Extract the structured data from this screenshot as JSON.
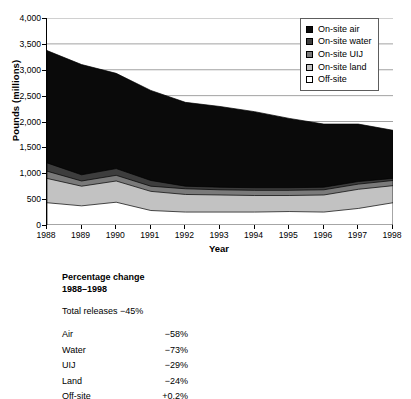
{
  "chart_data": {
    "type": "area",
    "stacked": true,
    "title": "",
    "xlabel": "Year",
    "ylabel": "Pounds (millions)",
    "x": [
      1988,
      1989,
      1990,
      1991,
      1992,
      1993,
      1994,
      1995,
      1996,
      1997,
      1998
    ],
    "xtick_labels": [
      "1988",
      "1989",
      "1990",
      "1991",
      "1992",
      "1993",
      "1994",
      "1995",
      "1996",
      "1997",
      "1998"
    ],
    "ytick_labels": [
      "0",
      "500",
      "1,000",
      "1,500",
      "2,000",
      "2,500",
      "3,000",
      "3,500",
      "4,000"
    ],
    "ylim": [
      0,
      4000
    ],
    "ytick_step": 500,
    "grid": "horizontal",
    "legend_position": "top-right",
    "stack_order_bottom_to_top": [
      "Off-site",
      "On-site land",
      "On-site UIJ",
      "On-site water",
      "On-site air"
    ],
    "series": [
      {
        "name": "On-site air",
        "color": "#0a0a0a",
        "values": [
          2170,
          2130,
          1840,
          1740,
          1620,
          1560,
          1470,
          1340,
          1220,
          1110,
          930
        ],
        "cumulative_top": [
          3370,
          3100,
          2930,
          2600,
          2370,
          2290,
          2190,
          2060,
          1950,
          1950,
          1830
        ]
      },
      {
        "name": "On-site water",
        "color": "#3d3d3d",
        "values": [
          160,
          120,
          130,
          110,
          50,
          50,
          50,
          50,
          50,
          50,
          40
        ],
        "cumulative_top": [
          1200,
          970,
          1090,
          860,
          750,
          730,
          720,
          720,
          730,
          840,
          900
        ]
      },
      {
        "name": "On-site UIJ",
        "color": "#7a7a7a",
        "values": [
          140,
          100,
          110,
          100,
          110,
          100,
          100,
          100,
          100,
          100,
          100
        ],
        "cumulative_top": [
          1040,
          850,
          960,
          750,
          700,
          680,
          670,
          670,
          680,
          790,
          860
        ]
      },
      {
        "name": "On-site land",
        "color": "#c2c2c2",
        "values": [
          470,
          380,
          410,
          370,
          340,
          330,
          320,
          310,
          330,
          370,
          330
        ],
        "cumulative_top": [
          900,
          750,
          850,
          650,
          590,
          580,
          570,
          570,
          580,
          690,
          760
        ]
      },
      {
        "name": "Off-site",
        "color": "#ffffff",
        "values": [
          430,
          370,
          440,
          280,
          250,
          250,
          250,
          260,
          250,
          320,
          430
        ],
        "cumulative_top": [
          430,
          370,
          440,
          280,
          250,
          250,
          250,
          260,
          250,
          320,
          430
        ]
      }
    ],
    "legend_entries": [
      {
        "label": "On-site air",
        "color": "#0a0a0a"
      },
      {
        "label": "On-site water",
        "color": "#3d3d3d"
      },
      {
        "label": "On-site UIJ",
        "color": "#7a7a7a"
      },
      {
        "label": "On-site land",
        "color": "#c2c2c2"
      },
      {
        "label": "Off-site",
        "color": "#ffffff"
      }
    ]
  },
  "footer": {
    "heading_line1": "Percentage change",
    "heading_line2": "1988–1998",
    "total_label": "Total releases −45%",
    "rows": [
      {
        "name": "Air",
        "value": "−58%"
      },
      {
        "name": "Water",
        "value": "−73%"
      },
      {
        "name": "UIJ",
        "value": "−29%"
      },
      {
        "name": "Land",
        "value": "−24%"
      },
      {
        "name": "Off-site",
        "value": "+0.2%"
      }
    ]
  }
}
